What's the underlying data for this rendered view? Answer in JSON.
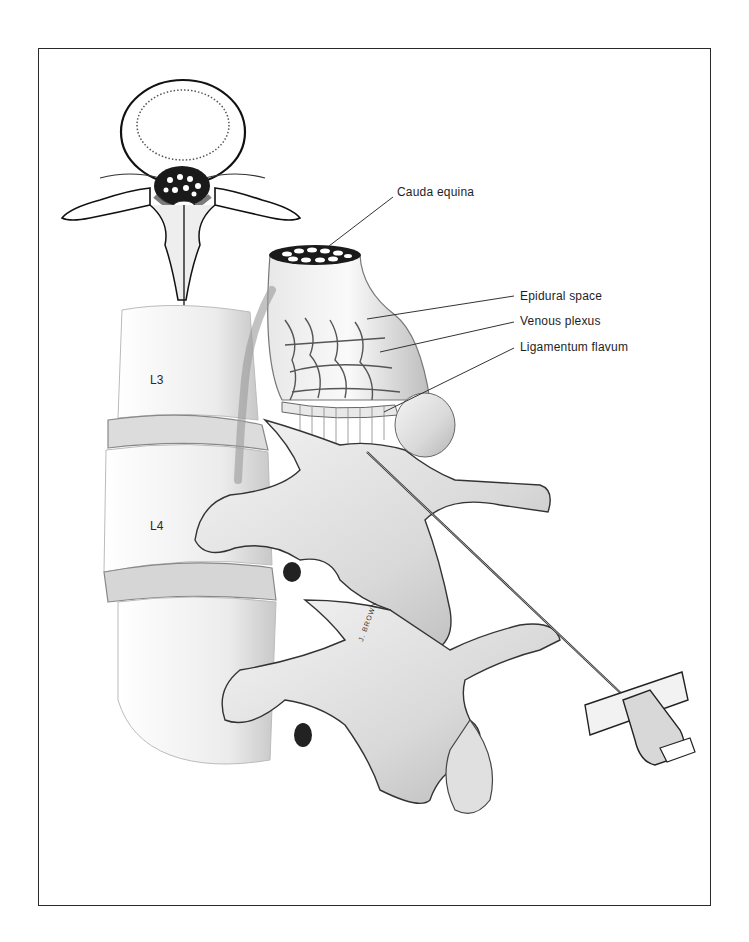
{
  "figure": {
    "border_color": "#2a2a2a"
  },
  "labels": {
    "cauda_equina": "Cauda equina",
    "epidural_space": "Epidural space",
    "venous_plexus": "Venous plexus",
    "ligamentum_flavum": "Ligamentum flavum"
  },
  "vertebra_labels": {
    "l3": "L3",
    "l4": "L4"
  },
  "artist_signature": "J. BROWN",
  "inset": {
    "description": "Axial cross-section of lumbar vertebra with needle path"
  }
}
